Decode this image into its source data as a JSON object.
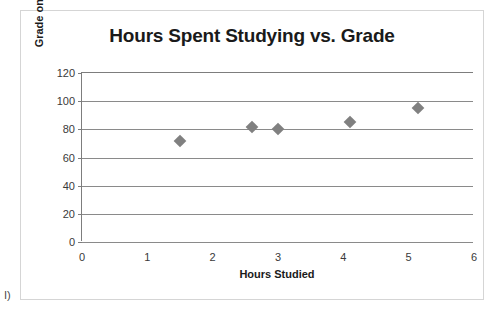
{
  "corner_note": "I)",
  "chart_data": {
    "type": "scatter",
    "title": "Hours Spent Studying vs. Grade",
    "xlabel": "Hours Studied",
    "ylabel": "Grade on Exam",
    "xlim": [
      0,
      6
    ],
    "ylim": [
      0,
      120
    ],
    "xticks": [
      "0",
      "1",
      "2",
      "3",
      "4",
      "5",
      "6"
    ],
    "yticks": [
      "0",
      "20",
      "40",
      "60",
      "80",
      "100",
      "120"
    ],
    "grid": "horizontal",
    "legend": "none",
    "marker": "diamond",
    "marker_color": "#808080",
    "points": [
      {
        "x": 1.5,
        "y": 72
      },
      {
        "x": 2.6,
        "y": 82
      },
      {
        "x": 3.0,
        "y": 80
      },
      {
        "x": 4.1,
        "y": 85
      },
      {
        "x": 5.15,
        "y": 95
      }
    ]
  }
}
